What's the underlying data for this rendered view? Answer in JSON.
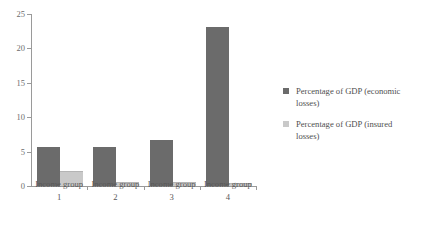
{
  "chart_data": {
    "type": "bar",
    "title": "",
    "subtitle": "",
    "xlabel": "",
    "ylabel": "",
    "ylim": [
      0,
      25
    ],
    "yticks": [
      0,
      5,
      10,
      15,
      20,
      25
    ],
    "ytick_labels": [
      "0",
      "5",
      "10",
      "15",
      "20",
      "25"
    ],
    "grid": false,
    "legend_position": "right",
    "categories": [
      "Income group 1",
      "Income group 2",
      "Income group 3",
      "Income group 4"
    ],
    "category_lines": [
      [
        "Income group",
        "1"
      ],
      [
        "Income group",
        "2"
      ],
      [
        "Income group",
        "3"
      ],
      [
        "Income group",
        "4"
      ]
    ],
    "series": [
      {
        "name": "Percentage of GDP (economic losses)",
        "color": "#6b6b6b",
        "values": [
          5.7,
          5.6,
          6.7,
          23.1
        ]
      },
      {
        "name": "Percentage of GDP (insured losses)",
        "color": "#c9c9c9",
        "values": [
          2.0,
          0.4,
          0.4,
          0.3
        ]
      }
    ]
  },
  "legend": {
    "entries": [
      {
        "label_line1": "Percentage of GDP (economic",
        "label_line2": "losses)",
        "color": "#6b6b6b"
      },
      {
        "label_line1": "Percentage of GDP (insured",
        "label_line2": "losses)",
        "color": "#c9c9c9"
      }
    ]
  },
  "axes": {
    "axis_color": "#9a9a9a",
    "tick_label_color": "#6d6d6d",
    "category_label_color": "#585858"
  },
  "canvas": {
    "background": "#ffffff",
    "width": 442,
    "height": 228
  }
}
